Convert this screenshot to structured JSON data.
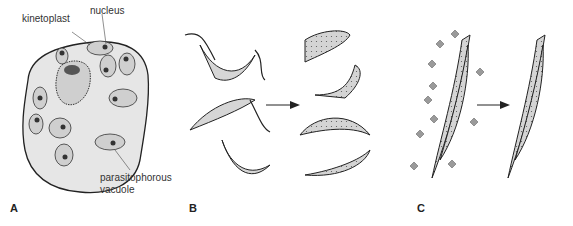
{
  "panels": [
    {
      "id": "A",
      "label": "A",
      "annotations": [
        "nucleus",
        "kinetoplast",
        "parasitophorous",
        "vacuole"
      ]
    },
    {
      "id": "B",
      "label": "B"
    },
    {
      "id": "C",
      "label": "C"
    }
  ],
  "colors": {
    "cell_fill": "#e6e6e6",
    "organism_fill": "#d0d0d0",
    "stroke": "#222222",
    "diamond": "#9a9a9a"
  }
}
